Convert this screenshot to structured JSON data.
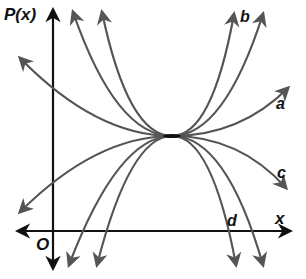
{
  "colors": {
    "axis": "#111111",
    "curve": "#555555",
    "label": "#111111",
    "background": "#ffffff"
  },
  "axes": {
    "origin": {
      "x": 53,
      "y": 231
    },
    "y_axis": {
      "label": "P(x)",
      "top": 10,
      "bottom": 268
    },
    "x_axis": {
      "label": "x",
      "left": 18,
      "right": 290
    },
    "origin_label": "O"
  },
  "vertex": {
    "x": 172,
    "y": 136
  },
  "curves": [
    {
      "id": "a",
      "label": "a",
      "shape": "upward-wide",
      "start": {
        "x": 20,
        "y": 58
      },
      "end": {
        "x": 288,
        "y": 88
      },
      "label_pos": {
        "x": 276,
        "y": 96
      }
    },
    {
      "id": "b",
      "label": "b",
      "shape": "upward-narrow",
      "start": {
        "x": 102,
        "y": 12
      },
      "end": {
        "x": 234,
        "y": 14
      },
      "label_pos": {
        "x": 240,
        "y": 12
      }
    },
    {
      "id": "b2",
      "label": "",
      "shape": "upward-narrowest",
      "start": {
        "x": 73,
        "y": 12
      },
      "end": {
        "x": 263,
        "y": 14
      }
    },
    {
      "id": "c",
      "label": "c",
      "shape": "downward-wide",
      "start": {
        "x": 20,
        "y": 212
      },
      "end": {
        "x": 286,
        "y": 188
      },
      "label_pos": {
        "x": 276,
        "y": 165
      }
    },
    {
      "id": "d",
      "label": "d",
      "shape": "downward-narrow",
      "start": {
        "x": 97,
        "y": 265
      },
      "end": {
        "x": 236,
        "y": 265
      },
      "label_pos": {
        "x": 227,
        "y": 213
      }
    },
    {
      "id": "d2",
      "label": "",
      "shape": "downward-narrowest",
      "start": {
        "x": 69,
        "y": 265
      },
      "end": {
        "x": 263,
        "y": 265
      }
    }
  ],
  "labels": {
    "y_axis": "P(x)",
    "x_axis": "x",
    "origin": "O",
    "a": "a",
    "b": "b",
    "c": "c",
    "d": "d"
  }
}
